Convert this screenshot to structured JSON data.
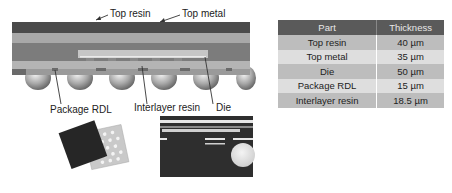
{
  "diagram": {
    "labels": {
      "top_resin": "Top resin",
      "top_metal": "Top metal",
      "package_rdl": "Package RDL",
      "interlayer_resin": "Interlayer resin",
      "die": "Die"
    }
  },
  "table": {
    "headers": [
      "Part",
      "Thickness"
    ],
    "rows": [
      {
        "part": "Top resin",
        "thickness": "40 µm"
      },
      {
        "part": "Top metal",
        "thickness": "35 µm"
      },
      {
        "part": "Die",
        "thickness": "50 µm"
      },
      {
        "part": "Package RDL",
        "thickness": "15 µm"
      },
      {
        "part": "Interlayer resin",
        "thickness": "18.5 µm"
      }
    ]
  },
  "colors": {
    "top_resin": "#4a4a4a",
    "top_metal": "#a8a8a8",
    "mold": "#7a7a7a",
    "die": "#c4c4c4",
    "table_header": "#5a5a5a"
  }
}
